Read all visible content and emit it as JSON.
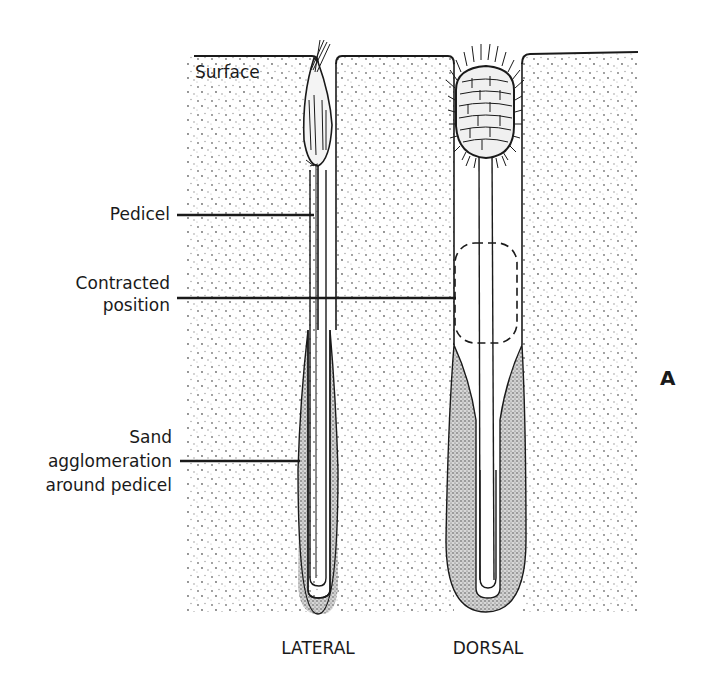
{
  "figure": {
    "panel_letter": "A",
    "surface_label": "Surface",
    "callouts": [
      {
        "id": "pedicel",
        "lines": [
          "Pedicel"
        ]
      },
      {
        "id": "contracted-position",
        "lines": [
          "Contracted",
          "position"
        ]
      },
      {
        "id": "sand-agglomeration",
        "lines": [
          "Sand",
          "agglomeration",
          "around pedicel"
        ]
      }
    ],
    "views": [
      {
        "id": "lateral",
        "label": "LATERAL"
      },
      {
        "id": "dorsal",
        "label": "DORSAL"
      }
    ],
    "colors": {
      "ink": "#1a1a1a",
      "background": "#ffffff",
      "sand_dot": "#6b6b6b",
      "agglomeration_fill": "#bdbdbd"
    }
  }
}
